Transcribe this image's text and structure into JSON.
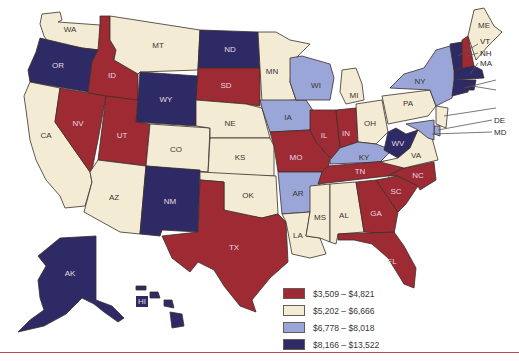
{
  "title": "",
  "colors": {
    "bin1": "#9e2a33",
    "bin2": "#f4ebd4",
    "bin3": "#9aa6d8",
    "bin4": "#2e2a66",
    "rule": "#c0464f"
  },
  "legend": {
    "items": [
      {
        "label": "$3,509 – $4,821",
        "bin": 1
      },
      {
        "label": "$5,202 – $6,666",
        "bin": 2
      },
      {
        "label": "$6,778 – $8,018",
        "bin": 3
      },
      {
        "label": "$8,166 – $13,522",
        "bin": 4
      }
    ]
  },
  "states": {
    "WA": 2,
    "OR": 4,
    "CA": 2,
    "ID": 1,
    "NV": 1,
    "MT": 2,
    "WY": 4,
    "UT": 1,
    "AZ": 2,
    "CO": 2,
    "NM": 4,
    "ND": 4,
    "SD": 1,
    "NE": 2,
    "KS": 2,
    "OK": 2,
    "TX": 1,
    "MN": 2,
    "IA": 3,
    "MO": 1,
    "AR": 3,
    "LA": 2,
    "WI": 3,
    "IL": 1,
    "MS": 2,
    "MI": 2,
    "IN": 1,
    "KY": 3,
    "TN": 1,
    "AL": 2,
    "OH": 2,
    "GA": 1,
    "FL": 1,
    "SC": 1,
    "NC": 1,
    "WV": 4,
    "VA": 2,
    "PA": 2,
    "NY": 3,
    "ME": 2,
    "VT": 4,
    "NH": 1,
    "MA": 4,
    "CT": 4,
    "RI": 4,
    "NJ": 2,
    "DE": 3,
    "MD": 3,
    "AK": 4,
    "HI": 4
  },
  "labels": {
    "WA": "WA",
    "OR": "OR",
    "CA": "CA",
    "ID": "ID",
    "NV": "NV",
    "MT": "MT",
    "WY": "WY",
    "UT": "UT",
    "AZ": "AZ",
    "CO": "CO",
    "NM": "NM",
    "ND": "ND",
    "SD": "SD",
    "NE": "NE",
    "KS": "KS",
    "OK": "OK",
    "TX": "TX",
    "MN": "MN",
    "IA": "IA",
    "MO": "MO",
    "AR": "AR",
    "LA": "LA",
    "WI": "WI",
    "IL": "IL",
    "MS": "MS",
    "MI": "MI",
    "IN": "IN",
    "KY": "KY",
    "TN": "TN",
    "AL": "AL",
    "OH": "OH",
    "GA": "GA",
    "FL": "FL",
    "SC": "SC",
    "NC": "NC",
    "WV": "WV",
    "VA": "VA",
    "PA": "PA",
    "NY": "NY",
    "ME": "ME",
    "AK": "AK",
    "HI": "HI"
  },
  "callouts": {
    "VT": "VT",
    "NH": "NH",
    "MA": "MA",
    "DE": "DE",
    "MD": "MD"
  }
}
